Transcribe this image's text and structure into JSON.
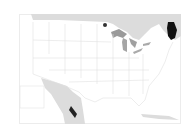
{
  "map": {
    "type": "choropleth",
    "region": "Contiguous United States",
    "highlighted_state": "Maine",
    "colors": {
      "highlight": "#111111",
      "neighbor_countries": "#d9d9d9",
      "great_lakes": "#9a9a9a",
      "state_borders": "#e2e2e2",
      "water": "#ffffff",
      "frame": "#e6e6e6"
    },
    "labels": []
  }
}
